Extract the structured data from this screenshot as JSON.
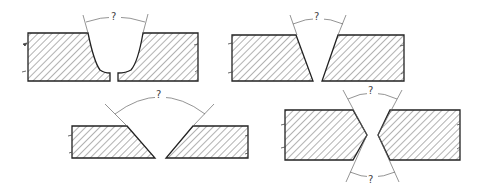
{
  "diagram": {
    "colors": {
      "outline": "#222222",
      "hatch": "#555555",
      "dimension": "#666666",
      "background": "#ffffff"
    },
    "figures": [
      {
        "id": "u-groove",
        "type": "single U-groove",
        "angle_labels": [
          "?"
        ]
      },
      {
        "id": "v-groove-narrow",
        "type": "single V-groove",
        "angle_labels": [
          "?"
        ]
      },
      {
        "id": "v-groove-wide",
        "type": "single V-groove (wide bevel)",
        "angle_labels": [
          "?"
        ]
      },
      {
        "id": "x-groove",
        "type": "double V-groove (X)",
        "angle_labels": [
          "?",
          "?"
        ]
      }
    ]
  }
}
